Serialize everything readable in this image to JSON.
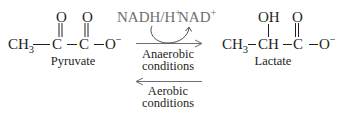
{
  "reaction": {
    "reactant": {
      "name": "Pyruvate",
      "formula_parts": {
        "ch3": "CH",
        "ch3_sub": "3",
        "c1": "C",
        "c2": "C",
        "o_minus": "O",
        "o_minus_sup": "−"
      },
      "carbonyl_o_1": "O",
      "carbonyl_o_2": "O"
    },
    "product": {
      "name": "Lactate",
      "formula_parts": {
        "ch3": "CH",
        "ch3_sub": "3",
        "ch": "CH",
        "c": "C",
        "o_minus": "O",
        "o_minus_sup": "−"
      },
      "hydroxyl": "OH",
      "carbonyl_o": "O"
    },
    "cofactors": {
      "in": "NADH/H",
      "in_sup": "+",
      "out": "NAD",
      "out_sup": "+"
    },
    "forward": {
      "line1": "Anaerobic",
      "line2": "conditions"
    },
    "reverse": {
      "line1": "Aerobic",
      "line2": "conditions"
    },
    "colors": {
      "text": "#231f20",
      "cofactor_text": "#6d6e71",
      "arrows": "#6d6e71"
    }
  }
}
